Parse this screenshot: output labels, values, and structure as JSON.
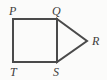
{
  "figure": {
    "name": "square-with-attached-triangle",
    "background_color": "#fbfbfa",
    "stroke_color": "#4a4a4a",
    "stroke_width": 2,
    "label_color": "#3d3d3d",
    "label_font_size": 12,
    "label_style": "italic-serif",
    "width": 107,
    "height": 80
  },
  "vertices": [
    {
      "id": "P",
      "label": "P",
      "x": 13,
      "y": 19,
      "label_x": 9,
      "label_y": 15
    },
    {
      "id": "Q",
      "label": "Q",
      "x": 57,
      "y": 19,
      "label_x": 52,
      "label_y": 15
    },
    {
      "id": "R",
      "label": "R",
      "x": 87,
      "y": 41,
      "label_x": 92,
      "label_y": 45
    },
    {
      "id": "S",
      "label": "S",
      "x": 57,
      "y": 62,
      "label_x": 53,
      "label_y": 76
    },
    {
      "id": "T",
      "label": "T",
      "x": 13,
      "y": 62,
      "label_x": 10,
      "label_y": 76
    }
  ],
  "shapes": {
    "square": {
      "name": "square-PQST",
      "points": "13,19 57,19 57,62 13,62",
      "vertex_order": [
        "P",
        "Q",
        "S",
        "T"
      ]
    },
    "triangle": {
      "name": "triangle-QRS",
      "points": "57,19 87,41 57,62",
      "vertex_order": [
        "Q",
        "R",
        "S"
      ]
    }
  },
  "edges": [
    {
      "name": "edge-PQ",
      "from": "P",
      "to": "Q",
      "x1": 13,
      "y1": 19,
      "x2": 57,
      "y2": 19
    },
    {
      "name": "edge-QS",
      "from": "Q",
      "to": "S",
      "x1": 57,
      "y1": 19,
      "x2": 57,
      "y2": 62
    },
    {
      "name": "edge-ST",
      "from": "S",
      "to": "T",
      "x1": 57,
      "y1": 62,
      "x2": 13,
      "y2": 62
    },
    {
      "name": "edge-TP",
      "from": "T",
      "to": "P",
      "x1": 13,
      "y1": 62,
      "x2": 13,
      "y2": 19
    },
    {
      "name": "edge-QR",
      "from": "Q",
      "to": "R",
      "x1": 57,
      "y1": 19,
      "x2": 87,
      "y2": 41
    },
    {
      "name": "edge-RS",
      "from": "R",
      "to": "S",
      "x1": 87,
      "y1": 41,
      "x2": 57,
      "y2": 62
    }
  ]
}
